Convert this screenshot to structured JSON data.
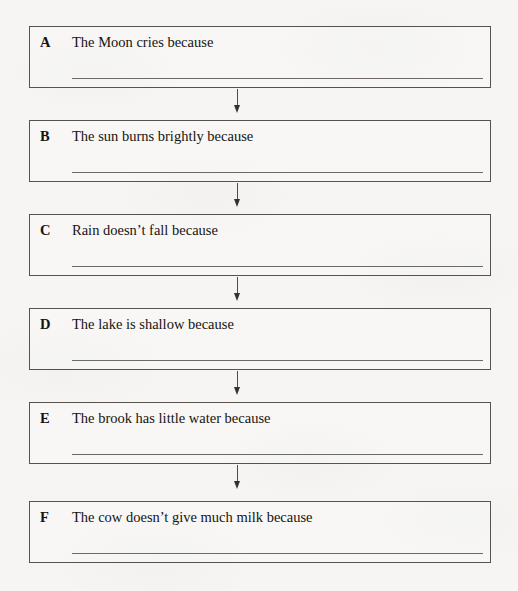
{
  "document": {
    "type": "worksheet-flow-chart",
    "title": "Cause and effect chain worksheet",
    "colors": {
      "paper": "#f6f5f3",
      "box_border": "#56524e",
      "answer_line": "#6d6964",
      "text": "#16140f",
      "arrow": "#35322e"
    },
    "connector": {
      "icon": "down-arrow-icon",
      "count": 5
    },
    "items": [
      {
        "letter": "A",
        "text": "The Moon cries because",
        "answer_value": ""
      },
      {
        "letter": "B",
        "text": "The sun burns brightly because",
        "answer_value": ""
      },
      {
        "letter": "C",
        "text": "Rain doesn’t fall because",
        "answer_value": ""
      },
      {
        "letter": "D",
        "text": "The lake is shallow because",
        "answer_value": ""
      },
      {
        "letter": "E",
        "text": "The brook has little water because",
        "answer_value": ""
      },
      {
        "letter": "F",
        "text": "The cow doesn’t give much milk because",
        "answer_value": ""
      }
    ]
  }
}
